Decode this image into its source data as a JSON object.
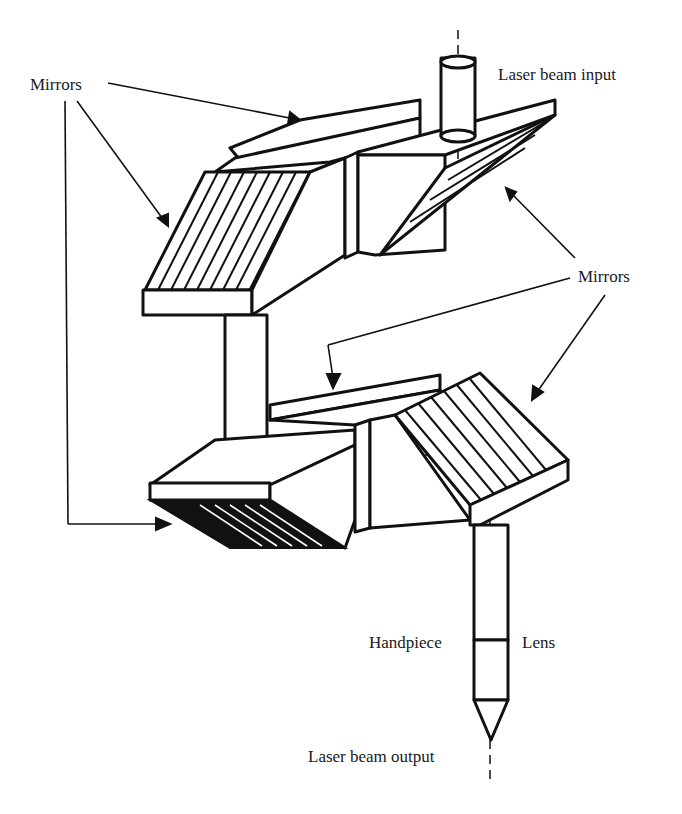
{
  "diagram": {
    "labels": {
      "mirrors_top_left": "Mirrors",
      "laser_beam_input": "Laser beam input",
      "mirrors_right": "Mirrors",
      "handpiece": "Handpiece",
      "lens": "Lens",
      "laser_beam_output": "Laser beam output"
    },
    "components": [
      "Upper joint block with two mirrors",
      "Input tube",
      "Vertical connecting tube",
      "Lower joint block with two mirrors",
      "Handpiece tube with lens",
      "Conical tip"
    ],
    "colors": {
      "line": "#111111",
      "background": "#ffffff"
    }
  }
}
